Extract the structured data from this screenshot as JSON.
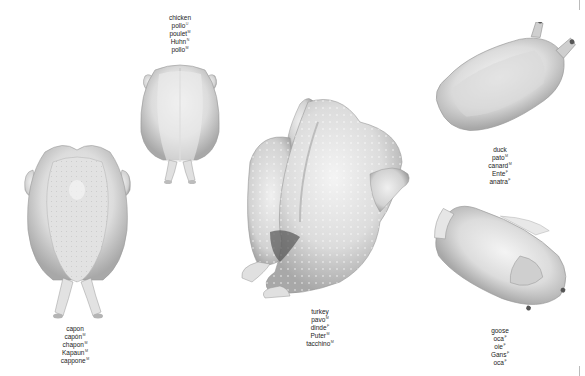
{
  "page": {
    "background": "#ffffff",
    "ink_color": "#222222"
  },
  "birds": {
    "chicken": {
      "names": [
        {
          "text": "chicken",
          "sup": ""
        },
        {
          "text": "pollo",
          "sup": "U"
        },
        {
          "text": "poulet",
          "sup": "M"
        },
        {
          "text": "Huhn",
          "sup": "N"
        },
        {
          "text": "pollo",
          "sup": "M"
        }
      ]
    },
    "capon": {
      "names": [
        {
          "text": "capon",
          "sup": ""
        },
        {
          "text": "capón",
          "sup": "M"
        },
        {
          "text": "chapon",
          "sup": "M"
        },
        {
          "text": "Kapaun",
          "sup": "M"
        },
        {
          "text": "cappone",
          "sup": "M"
        }
      ]
    },
    "turkey": {
      "names": [
        {
          "text": "turkey",
          "sup": ""
        },
        {
          "text": "pavo",
          "sup": "M"
        },
        {
          "text": "dinde",
          "sup": "F"
        },
        {
          "text": "Puter",
          "sup": "M"
        },
        {
          "text": "tacchino",
          "sup": "M"
        }
      ]
    },
    "duck": {
      "names": [
        {
          "text": "duck",
          "sup": ""
        },
        {
          "text": "pato",
          "sup": "M"
        },
        {
          "text": "canard",
          "sup": "M"
        },
        {
          "text": "Ente",
          "sup": "F"
        },
        {
          "text": "anatra",
          "sup": "F"
        }
      ]
    },
    "goose": {
      "names": [
        {
          "text": "goose",
          "sup": ""
        },
        {
          "text": "oca",
          "sup": "F"
        },
        {
          "text": "oie",
          "sup": "F"
        },
        {
          "text": "Gans",
          "sup": "F"
        },
        {
          "text": "oca",
          "sup": "F"
        }
      ]
    }
  }
}
